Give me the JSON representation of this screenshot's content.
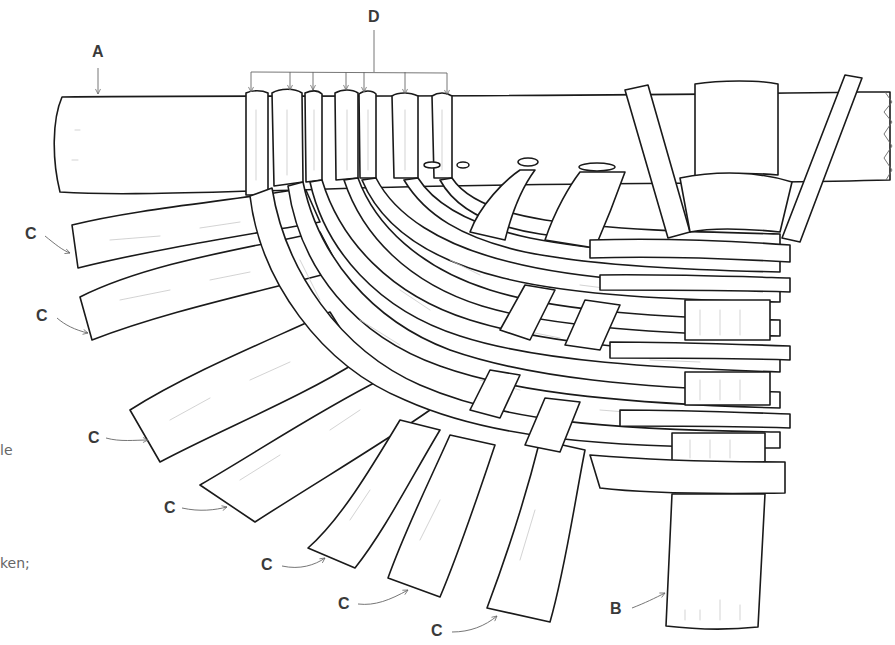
{
  "figure": {
    "labels": {
      "a": "A",
      "b": "B",
      "c": "C",
      "d": "D"
    },
    "c_label_count": 7,
    "d_arrow_count": 7
  },
  "caption_fragments": {
    "line1": "le",
    "line2": "ken;"
  },
  "colors": {
    "ink": "#1a1a1a",
    "label": "#3a3a3a",
    "leader": "#666666",
    "background": "#ffffff"
  }
}
